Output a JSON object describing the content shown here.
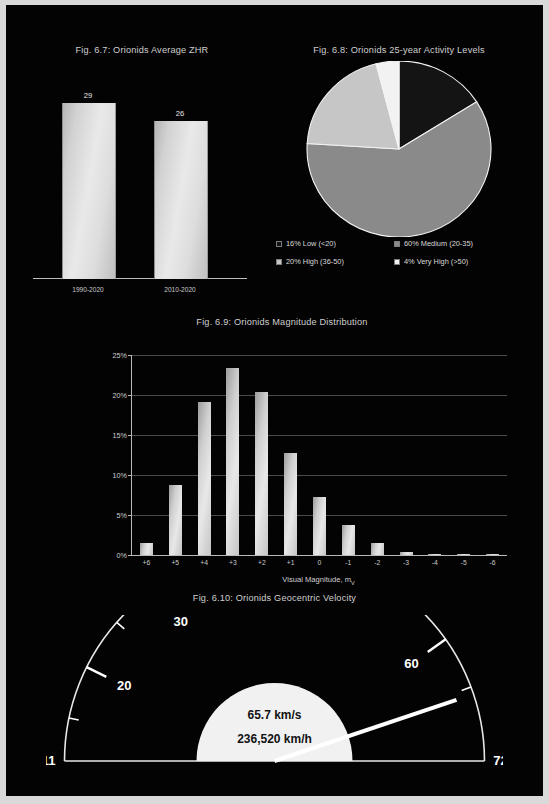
{
  "page": {
    "background": "#030303",
    "margin_color": "#d9d9d9"
  },
  "fig67": {
    "title": "Fig. 6.7: Orionids Average ZHR",
    "categories": [
      "1990-2020",
      "2010-2020"
    ],
    "values": [
      29,
      26
    ],
    "value_labels": [
      "29",
      "26"
    ]
  },
  "fig68": {
    "title": "Fig. 6.8: Orionids 25-year Activity Levels",
    "legend": [
      {
        "label": "16% Low (<20)",
        "color": "#141414"
      },
      {
        "label": "60% Medium (20-35)",
        "color": "#8a8a8a"
      },
      {
        "label": "20% High (36-50)",
        "color": "#c6c6c6"
      },
      {
        "label": "4% Very High (>50)",
        "color": "#f2f2f2"
      }
    ]
  },
  "fig69": {
    "title": "Fig. 6.9: Orionids Magnitude Distribution",
    "xaxis_title": "Visual Magnitude, m",
    "xaxis_title_sub": "V",
    "yticks": [
      "0%",
      "5%",
      "10%",
      "15%",
      "20%",
      "25%"
    ]
  },
  "fig610": {
    "title": "Fig. 6.10: Orionids Geocentric Velocity",
    "min_label": "11",
    "max_label": "72",
    "tick_labels": [
      "20",
      "30",
      "40",
      "50",
      "60"
    ],
    "value_kms": "65.7 km/s",
    "value_kmh": "236,520 km/h"
  },
  "chart_data": [
    {
      "type": "bar",
      "title": "Fig. 6.7: Orionids Average ZHR",
      "categories": [
        "1990-2020",
        "2010-2020"
      ],
      "values": [
        29,
        26
      ],
      "ylim": [
        0,
        33
      ],
      "xlabel": "",
      "ylabel": "",
      "grid": false,
      "legend": "none"
    },
    {
      "type": "pie",
      "title": "Fig. 6.8: Orionids 25-year Activity Levels",
      "labels": [
        "Low (<20)",
        "Medium (20-35)",
        "High (36-50)",
        "Very High (>50)"
      ],
      "values": [
        16,
        60,
        20,
        4
      ],
      "colors": [
        "#141414",
        "#8a8a8a",
        "#c6c6c6",
        "#f2f2f2"
      ],
      "legend": "bottom",
      "start_angle_deg": 0,
      "direction": "clockwise"
    },
    {
      "type": "bar",
      "title": "Fig. 6.9: Orionids Magnitude Distribution",
      "categories": [
        "+6",
        "+5",
        "+4",
        "+3",
        "+2",
        "+1",
        "0",
        "-1",
        "-2",
        "-3",
        "-4",
        "-5",
        "-6"
      ],
      "values": [
        1.5,
        8.7,
        19.1,
        23.4,
        20.4,
        12.8,
        7.2,
        3.7,
        1.5,
        0.4,
        0.15,
        0.05,
        0.03
      ],
      "xlabel": "Visual Magnitude, mV",
      "ylabel": "",
      "ylim": [
        0,
        25
      ],
      "yticks": [
        0,
        5,
        10,
        15,
        20,
        25
      ],
      "ytick_labels": [
        "0%",
        "5%",
        "10%",
        "15%",
        "20%",
        "25%"
      ],
      "grid": true,
      "legend": "none"
    },
    {
      "type": "gauge",
      "title": "Fig. 6.10: Orionids Geocentric Velocity",
      "min": 11,
      "max": 72,
      "value": 65.7,
      "major_ticks": [
        20,
        30,
        40,
        50,
        60
      ],
      "minor_ticks": [
        15,
        25,
        35,
        45,
        55,
        65
      ],
      "center_text": [
        "65.7 km/s",
        "236,520 km/h"
      ],
      "min_label": "11",
      "max_label": "72"
    }
  ]
}
